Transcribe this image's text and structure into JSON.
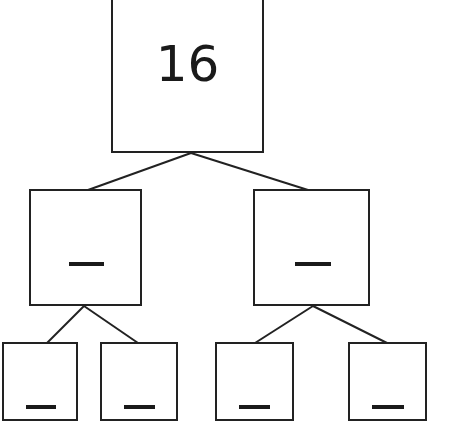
{
  "diagram": {
    "type": "number-bond-tree",
    "root": {
      "value": "16"
    },
    "level2": [
      {
        "value": "—",
        "blank": true
      },
      {
        "value": "—",
        "blank": true
      }
    ],
    "level3": [
      {
        "value": "—",
        "blank": true
      },
      {
        "value": "—",
        "blank": true
      },
      {
        "value": "—",
        "blank": true
      },
      {
        "value": "—",
        "blank": true
      }
    ],
    "colors": {
      "stroke": "#222222",
      "background": "#ffffff"
    }
  }
}
